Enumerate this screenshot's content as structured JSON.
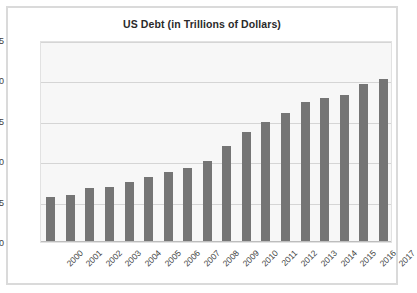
{
  "chart_data": {
    "type": "bar",
    "title": "US Debt (in Trillions of Dollars)",
    "xlabel": "",
    "ylabel": "",
    "categories": [
      "2000",
      "2001",
      "2002",
      "2003",
      "2004",
      "2005",
      "2006",
      "2007",
      "2008",
      "2009",
      "2010",
      "2011",
      "2012",
      "2013",
      "2014",
      "2015",
      "2016",
      "2017"
    ],
    "values": [
      5.6,
      5.8,
      6.7,
      6.8,
      7.4,
      8.0,
      8.7,
      9.2,
      10.0,
      11.9,
      13.6,
      14.8,
      16.0,
      17.3,
      17.8,
      18.2,
      19.6,
      20.2
    ],
    "ylim": [
      0,
      25
    ],
    "yticks": [
      0,
      5,
      10,
      15,
      20,
      25
    ],
    "ytick_labels": [
      "0",
      "5",
      "10",
      "15",
      "20",
      "25"
    ],
    "grid": true,
    "legend": false,
    "legend_position": "none",
    "series": [
      {
        "name": "US Debt",
        "values": [
          5.6,
          5.8,
          6.7,
          6.8,
          7.4,
          8.0,
          8.7,
          9.2,
          10.0,
          11.9,
          13.6,
          14.8,
          16.0,
          17.3,
          17.8,
          18.2,
          19.6,
          20.2
        ]
      }
    ],
    "colors": {
      "bar": "#757575",
      "plot_background": "#f7f7f7",
      "gridline": "#d5d5d5",
      "card_border": "#dadada",
      "text": "#2a2a2a"
    }
  }
}
